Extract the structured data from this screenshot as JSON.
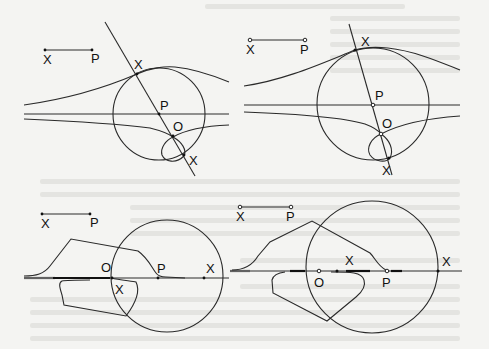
{
  "figure": {
    "stroke_color": "#2a2a2a",
    "background_color": "#f4f4f2",
    "panels": [
      {
        "id": "top-left",
        "ruler": {
          "start_label": "X",
          "end_label": "P"
        },
        "labels": {
          "x_upper": "X",
          "p_center": "P",
          "o_origin": "O",
          "x_lower": "X"
        }
      },
      {
        "id": "top-right",
        "ruler": {
          "start_label": "X",
          "end_label": "P"
        },
        "labels": {
          "x_upper": "X",
          "p_center": "P",
          "o_origin": "O",
          "x_lower": "X"
        }
      },
      {
        "id": "bottom-left",
        "ruler": {
          "start_label": "X",
          "end_label": "P"
        },
        "labels": {
          "o_origin": "O",
          "p_center": "P",
          "x_right": "X",
          "x_inner": "X"
        }
      },
      {
        "id": "bottom-right",
        "ruler": {
          "start_label": "X",
          "end_label": "P"
        },
        "labels": {
          "x_left": "X",
          "o_origin": "O",
          "p_center": "P",
          "x_right": "X"
        }
      }
    ]
  }
}
